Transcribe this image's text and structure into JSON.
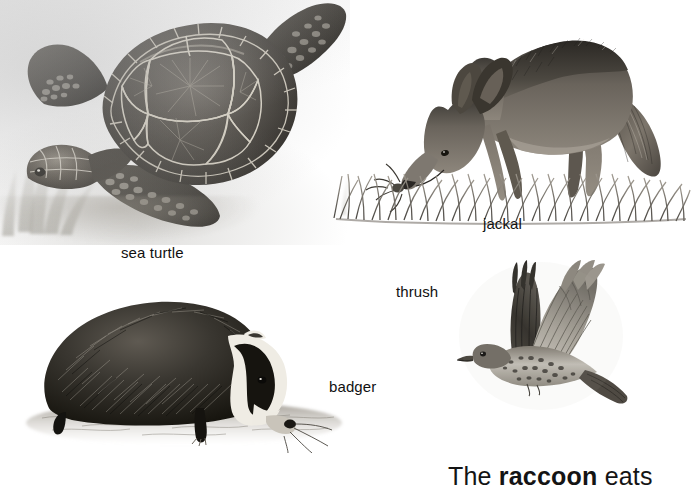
{
  "page": {
    "background_color": "#ffffff",
    "ink_color": "#111111"
  },
  "figures": [
    {
      "id": "sea-turtle",
      "label": "sea turtle",
      "description": "graphite drawing of a green sea turtle swimming above the sea floor with seaweed",
      "label_position": {
        "x": 121,
        "y": 244
      }
    },
    {
      "id": "jackal",
      "label": "jackal",
      "description": "graphite drawing of a jackal standing in grass with its head lowered, sniffing",
      "label_position": {
        "x": 483,
        "y": 215
      }
    },
    {
      "id": "badger",
      "label": "badger",
      "description": "graphite drawing of a badger with striped face snuffling on the ground",
      "label_position": {
        "x": 329,
        "y": 378
      }
    },
    {
      "id": "thrush",
      "label": "thrush",
      "description": "graphite drawing of a speckled thrush in flight with wings raised",
      "label_position": {
        "x": 396,
        "y": 283
      }
    }
  ],
  "sentence": {
    "lead": "The ",
    "emphasis": "raccoon",
    "trail": " eats",
    "position": {
      "x": 448,
      "y": 464
    }
  }
}
